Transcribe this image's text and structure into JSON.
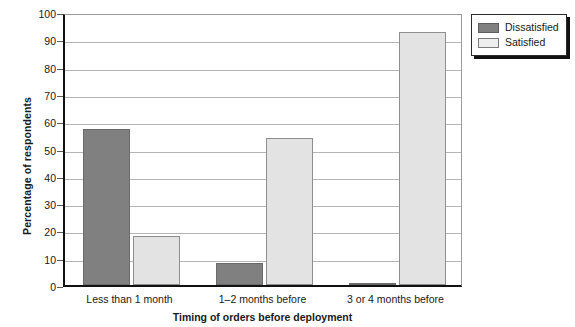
{
  "chart_data": {
    "type": "bar",
    "title": "",
    "xlabel": "Timing of orders before deployment",
    "ylabel": "Percentage of respondents",
    "categories": [
      "Less than 1 month",
      "1–2 months before",
      "3 or 4 months before"
    ],
    "series": [
      {
        "name": "Dissatisfied",
        "color": "#808080",
        "values": [
          57,
          8,
          0.5
        ]
      },
      {
        "name": "Satisfied",
        "color": "#e3e3e3",
        "values": [
          18,
          54,
          92.5
        ]
      }
    ],
    "ylim": [
      0,
      100
    ],
    "yticks": [
      0,
      10,
      20,
      30,
      40,
      50,
      60,
      70,
      80,
      90,
      100
    ],
    "ytick_labels": [
      "0",
      "10",
      "20",
      "30",
      "40",
      "50",
      "60",
      "70",
      "80",
      "90",
      "100"
    ],
    "grid": true,
    "grid_axis": "y",
    "legend_position": "upper right outside",
    "legend_entries": [
      "Dissatisfied",
      "Satisfied"
    ]
  },
  "legend": {
    "items": [
      {
        "label": "Dissatisfied",
        "swatch": "dissatisfied"
      },
      {
        "label": "Satisfied",
        "swatch": "satisfied"
      }
    ]
  },
  "axes": {
    "y_title": "Percentage of respondents",
    "x_title": "Timing of orders before deployment"
  }
}
